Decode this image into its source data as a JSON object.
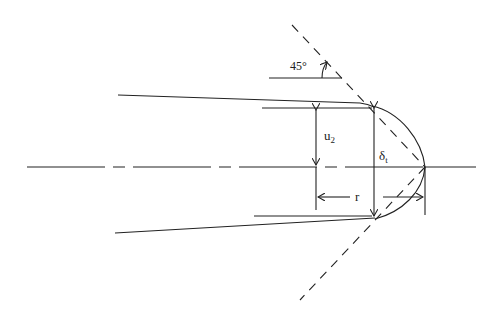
{
  "diagram": {
    "type": "engineering-cross-section",
    "labels": {
      "angle": "45°",
      "u2": "u",
      "u2_sub": "2",
      "delta": "δ",
      "delta_sub": "t",
      "radius": "r"
    },
    "colors": {
      "stroke": "#222222",
      "background": "#ffffff"
    }
  }
}
